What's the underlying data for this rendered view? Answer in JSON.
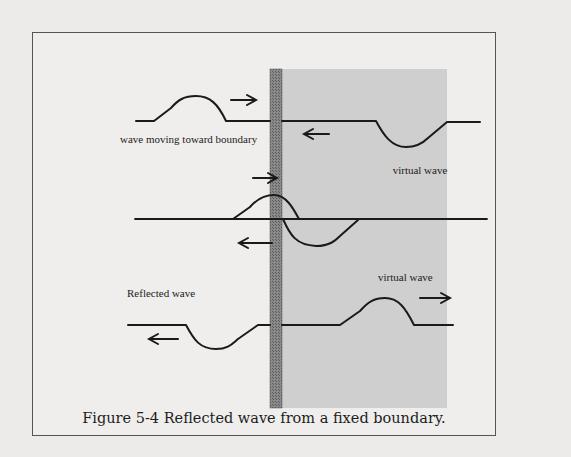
{
  "figure": {
    "caption": "Figure 5-4 Reflected wave from a fixed boundary.",
    "labels": {
      "incident": "wave moving toward boundary",
      "virtual_top": "virtual wave",
      "reflected": "Reflected wave",
      "virtual_bottom": "virtual wave"
    },
    "icons": {
      "arrow_right": "arrow-right-icon",
      "arrow_left": "arrow-left-icon"
    },
    "colors": {
      "page": "#ecebea",
      "virtual_region": "#cfcfcf",
      "boundary": "#6e6e6e",
      "stroke": "#1a1a1a"
    },
    "panels": [
      {
        "name": "incident",
        "pulse_left": "up-pulse moving right",
        "pulse_right": "down-pulse (virtual) moving left"
      },
      {
        "name": "superposition",
        "pulse_left": "up-pulse moving right",
        "pulse_right": "down-pulse moving left"
      },
      {
        "name": "reflected",
        "pulse_left": "down-pulse (reflected) moving left",
        "pulse_right": "up-pulse (virtual) moving right"
      }
    ]
  }
}
